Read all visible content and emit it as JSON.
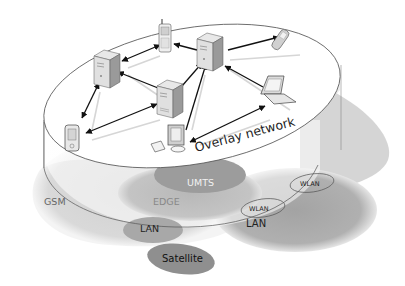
{
  "diagram": {
    "overlay_label": "Overlay network",
    "access_networks": [
      {
        "id": "gsm",
        "label": "GSM"
      },
      {
        "id": "edge",
        "label": "EDGE"
      },
      {
        "id": "umts",
        "label": "UMTS"
      },
      {
        "id": "lan_left",
        "label": "LAN"
      },
      {
        "id": "lan_right",
        "label": "LAN"
      },
      {
        "id": "wlan_1",
        "label": "WLAN"
      },
      {
        "id": "wlan_2",
        "label": "WLAN"
      },
      {
        "id": "satellite",
        "label": "Satellite"
      }
    ],
    "nodes": [
      {
        "id": "server-left",
        "type": "server-icon"
      },
      {
        "id": "server-center",
        "type": "server-icon"
      },
      {
        "id": "server-right",
        "type": "server-icon"
      },
      {
        "id": "mobile-phone-top",
        "type": "mobile-phone-icon"
      },
      {
        "id": "flip-phone",
        "type": "flip-phone-icon"
      },
      {
        "id": "laptop",
        "type": "laptop-icon"
      },
      {
        "id": "pda",
        "type": "pda-icon"
      },
      {
        "id": "desktop",
        "type": "desktop-computer-icon"
      }
    ],
    "links": [
      [
        "server-left",
        "mobile-phone-top"
      ],
      [
        "server-left",
        "server-center"
      ],
      [
        "server-left",
        "pda"
      ],
      [
        "server-center",
        "pda"
      ],
      [
        "server-center",
        "server-right"
      ],
      [
        "server-right",
        "mobile-phone-top"
      ],
      [
        "server-right",
        "flip-phone"
      ],
      [
        "server-right",
        "laptop"
      ],
      [
        "server-right",
        "desktop"
      ],
      [
        "desktop",
        "laptop"
      ]
    ],
    "colors": {
      "gsm": "#d4d4d4",
      "edge": "#bdbdbd",
      "umts": "#9a9a9a",
      "lan": "#a6a6a6",
      "lan_right": "#ababab",
      "satellite": "#8e8e8e",
      "disk": "#ffffff",
      "outline": "#555555",
      "arrow": "#111111"
    }
  }
}
